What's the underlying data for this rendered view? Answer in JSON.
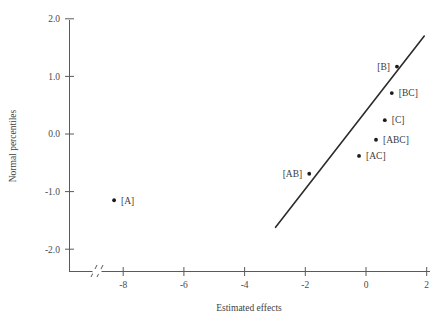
{
  "chart_data": {
    "type": "scatter",
    "title": "",
    "xlabel": "Estimated effects",
    "ylabel": "Normal percentiles",
    "xlim": [
      -9.2,
      2.4
    ],
    "ylim": [
      -2.45,
      2.15
    ],
    "xticks": [
      -8,
      -6,
      -4,
      -2,
      0,
      2
    ],
    "xtick_labels": [
      "-8",
      "-6",
      "-4",
      "-2",
      "0",
      "2"
    ],
    "yticks": [
      2.0,
      1.0,
      0.0,
      -1.0,
      -2.0
    ],
    "ytick_labels": [
      "2.0",
      "1.0",
      "0.0",
      "-1.0",
      "-2.0"
    ],
    "grid": false,
    "legend": "none",
    "axis_break": {
      "present": true,
      "axis": "x",
      "symbol": "//",
      "position": -9.0
    },
    "points": [
      {
        "label": "[A]",
        "x": -8.3,
        "y": -1.15,
        "label_side": "right"
      },
      {
        "label": "[AB]",
        "x": -1.87,
        "y": -0.69,
        "label_side": "left"
      },
      {
        "label": "[AC]",
        "x": -0.23,
        "y": -0.38,
        "label_side": "right"
      },
      {
        "label": "[ABC]",
        "x": 0.33,
        "y": -0.1,
        "label_side": "right"
      },
      {
        "label": "[C]",
        "x": 0.62,
        "y": 0.24,
        "label_side": "right"
      },
      {
        "label": "[BC]",
        "x": 0.85,
        "y": 0.71,
        "label_side": "right"
      },
      {
        "label": "[B]",
        "x": 1.02,
        "y": 1.17,
        "label_side": "left"
      }
    ],
    "reference_line": {
      "x1": -2.98,
      "y1": -1.62,
      "x2": 1.92,
      "y2": 1.7
    },
    "colors": {
      "point": "#1c1c1c",
      "line": "#2b2b2b",
      "axis": "#5a5a5a",
      "text": "#3a3a3a",
      "background": "#ffffff"
    }
  }
}
